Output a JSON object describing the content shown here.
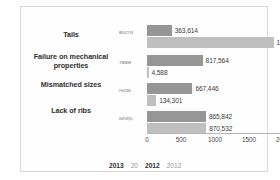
{
  "chart_data": {
    "type": "bar",
    "orientation": "horizontal",
    "title": "",
    "xlabel": "",
    "ylabel": "",
    "categories": [
      "Tails",
      "Failure on mechanical properties",
      "Mismatched sizes",
      "Lack of ribs"
    ],
    "inner_axis_labels": [
      "вости",
      "твам",
      "геом.",
      "юпер."
    ],
    "series": [
      {
        "name": "2013",
        "color": "#969696",
        "values": [
          363.614,
          817.564,
          667.446,
          865.842
        ],
        "labels": [
          "363,614",
          "817,564",
          "667,446",
          "865,842"
        ]
      },
      {
        "name": "2012",
        "color": "#bfbfbf",
        "values": [
          1861.344,
          4.588,
          134.301,
          870.532
        ],
        "labels": [
          "1861,344",
          "4,588",
          "134,301",
          "870,532"
        ]
      }
    ],
    "xticks": [
      "0",
      "500",
      "1000",
      "1500",
      "2000"
    ],
    "xlim": [
      0,
      2000
    ],
    "grid": false,
    "legend_position": "bottom",
    "legend_entries": [
      "2013",
      "20",
      "2012",
      "2012"
    ]
  }
}
